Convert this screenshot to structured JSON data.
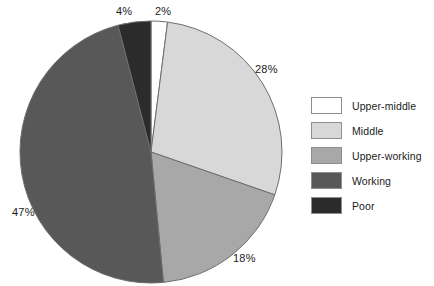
{
  "chart_data": {
    "type": "pie",
    "title": "",
    "labels": [
      "Upper-middle",
      "Middle",
      "Upper-working",
      "Working",
      "Poor"
    ],
    "values": [
      2,
      28,
      18,
      47,
      4
    ],
    "value_labels": [
      "2%",
      "28%",
      "18%",
      "47%",
      "4%"
    ],
    "unit": "%",
    "total": 100,
    "start_angle_deg": 0,
    "direction": "clockwise",
    "colors": [
      "#ffffff",
      "#d8d8d8",
      "#a8a8a8",
      "#585858",
      "#2b2b2b"
    ],
    "stroke_color": "#6e6e6e",
    "legend": {
      "position": "right",
      "entries": [
        {
          "label": "Upper-middle",
          "color": "#ffffff"
        },
        {
          "label": "Middle",
          "color": "#d8d8d8"
        },
        {
          "label": "Upper-working",
          "color": "#a8a8a8"
        },
        {
          "label": "Working",
          "color": "#585858"
        },
        {
          "label": "Poor",
          "color": "#2b2b2b"
        }
      ]
    },
    "annotations": [
      {
        "text": "2%",
        "slice": "Upper-middle"
      },
      {
        "text": "28%",
        "slice": "Middle"
      },
      {
        "text": "18%",
        "slice": "Upper-working"
      },
      {
        "text": "47%",
        "slice": "Working"
      },
      {
        "text": "4%",
        "slice": "Poor"
      }
    ],
    "grid": false,
    "xlabel": "",
    "ylabel": ""
  },
  "labels": {
    "upper_middle_pct": "2%",
    "middle_pct": "28%",
    "upper_working_pct": "18%",
    "working_pct": "47%",
    "poor_pct": "4%"
  },
  "legend_items": {
    "item0": "Upper-middle",
    "item1": "Middle",
    "item2": "Upper-working",
    "item3": "Working",
    "item4": "Poor"
  }
}
